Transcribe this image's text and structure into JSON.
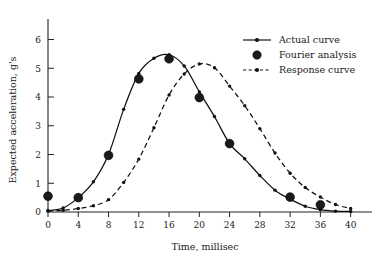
{
  "chart_data": {
    "type": "line",
    "title": "",
    "xlabel": "Time, millisec",
    "ylabel": "Expected acceleration, g's",
    "xlim": [
      0,
      41.5
    ],
    "ylim": [
      0,
      6.4
    ],
    "xticks": [
      0,
      4,
      8,
      12,
      16,
      20,
      24,
      28,
      32,
      36,
      40
    ],
    "yticks": [
      0,
      1,
      2,
      3,
      4,
      5,
      6
    ],
    "grid": false,
    "legend_position": "top-right",
    "legend": [
      {
        "label": "Actual curve",
        "style": "solid-line-with-dot"
      },
      {
        "label": "Fourier analysis",
        "style": "large-filled-circle"
      },
      {
        "label": "Response curve",
        "style": "dashed-line-with-dot"
      }
    ],
    "series": [
      {
        "name": "Actual curve",
        "style": "solid",
        "marker": "small-dot",
        "x": [
          0,
          2,
          4,
          6,
          8,
          10,
          12,
          14,
          16,
          18,
          20,
          22,
          24,
          26,
          28,
          30,
          32,
          34,
          36,
          38,
          40
        ],
        "values": [
          0.05,
          0.14,
          0.5,
          1.05,
          2.0,
          3.57,
          4.82,
          5.35,
          5.47,
          5.08,
          4.18,
          3.32,
          2.38,
          1.85,
          1.27,
          0.76,
          0.45,
          0.2,
          0.08,
          0.03,
          0.02
        ]
      },
      {
        "name": "Response curve",
        "style": "dashed",
        "marker": "small-dot",
        "x": [
          0,
          2,
          4,
          6,
          8,
          10,
          12,
          14,
          16,
          18,
          20,
          22,
          24,
          26,
          28,
          30,
          32,
          34,
          36,
          38,
          40
        ],
        "values": [
          0.03,
          0.06,
          0.12,
          0.22,
          0.43,
          1.03,
          1.84,
          2.93,
          4.07,
          4.8,
          5.15,
          5.02,
          4.38,
          3.7,
          2.9,
          2.05,
          1.35,
          0.85,
          0.52,
          0.26,
          0.12
        ]
      },
      {
        "name": "Fourier analysis",
        "style": "markers",
        "marker": "large-filled-circle",
        "x": [
          0,
          4,
          8,
          12,
          16,
          20,
          24,
          32,
          36
        ],
        "values": [
          0.55,
          0.5,
          1.97,
          4.63,
          5.33,
          3.98,
          2.38,
          0.52,
          0.25
        ]
      }
    ]
  }
}
